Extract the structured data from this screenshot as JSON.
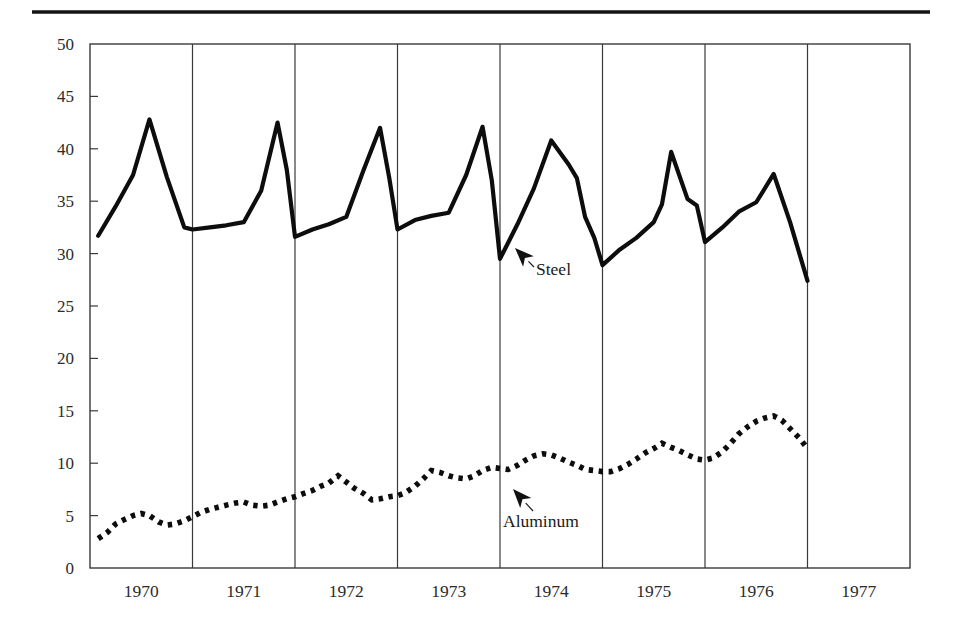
{
  "figure": {
    "top_rule": true,
    "background_color": "#ffffff",
    "line_color": "#0d0d0d",
    "axis_color": "#3a3a3a"
  },
  "annotations": [
    {
      "name": "steel",
      "label": "Steel",
      "label_x": 536,
      "label_y": 275,
      "arrow_tip_x": 515,
      "arrow_tip_y": 248,
      "arrow_tail_x": 534,
      "arrow_tail_y": 267
    },
    {
      "name": "aluminum",
      "label": "Aluminum",
      "label_x": 503,
      "label_y": 527,
      "arrow_tip_x": 513,
      "arrow_tip_y": 489,
      "arrow_tail_x": 533,
      "arrow_tail_y": 511
    }
  ],
  "chart_data": {
    "type": "line",
    "title": "",
    "subtitle": "",
    "xlabel": "",
    "ylabel": "",
    "xlim": [
      1969.5,
      1977.5
    ],
    "ylim": [
      0,
      50
    ],
    "grid": "vertical year boundaries",
    "legend_position": "inline-annotations",
    "y_ticks": [
      0,
      5,
      10,
      15,
      20,
      25,
      30,
      35,
      40,
      45,
      50
    ],
    "y_tick_labels": [
      "0",
      "5",
      "10",
      "15",
      "20",
      "25",
      "30",
      "35",
      "40",
      "45",
      "50"
    ],
    "x_tick_labels": [
      "1970",
      "1971",
      "1972",
      "1973",
      "1974",
      "1975",
      "1976",
      "1977"
    ],
    "x_gridline_years": [
      1970.5,
      1971.5,
      1972.5,
      1973.5,
      1974.5,
      1975.5,
      1976.5
    ],
    "series": [
      {
        "name": "Steel",
        "style": "solid",
        "x": [
          1969.58,
          1969.75,
          1969.92,
          1970.08,
          1970.25,
          1970.42,
          1970.5,
          1970.67,
          1970.83,
          1971.0,
          1971.17,
          1971.33,
          1971.42,
          1971.5,
          1971.67,
          1971.83,
          1972.0,
          1972.17,
          1972.33,
          1972.42,
          1972.5,
          1972.67,
          1972.83,
          1973.0,
          1973.17,
          1973.33,
          1973.42,
          1973.5,
          1973.67,
          1973.83,
          1974.0,
          1974.17,
          1974.25,
          1974.33,
          1974.42,
          1974.5,
          1974.67,
          1974.83,
          1975.0,
          1975.08,
          1975.17,
          1975.33,
          1975.42,
          1975.5,
          1975.67,
          1975.83,
          1976.0,
          1976.17,
          1976.33,
          1976.5
        ],
        "y": [
          31.7,
          34.5,
          37.5,
          42.8,
          37.3,
          32.5,
          32.3,
          32.5,
          32.7,
          33.0,
          36.0,
          42.5,
          38.0,
          31.6,
          32.3,
          32.8,
          33.5,
          38.0,
          42.0,
          37.2,
          32.3,
          33.2,
          33.6,
          33.9,
          37.5,
          42.1,
          37.0,
          29.5,
          32.8,
          36.2,
          40.8,
          38.5,
          37.2,
          33.5,
          31.5,
          28.9,
          30.4,
          31.5,
          33.0,
          34.7,
          39.7,
          35.2,
          34.6,
          31.1,
          32.5,
          34.0,
          34.9,
          37.6,
          33.0,
          27.4
        ]
      },
      {
        "name": "Aluminum",
        "style": "dotted",
        "x": [
          1969.58,
          1969.67,
          1969.75,
          1969.83,
          1969.92,
          1970.0,
          1970.08,
          1970.17,
          1970.25,
          1970.33,
          1970.42,
          1970.5,
          1970.58,
          1970.67,
          1970.75,
          1970.83,
          1970.92,
          1971.0,
          1971.08,
          1971.17,
          1971.25,
          1971.33,
          1971.42,
          1971.5,
          1971.58,
          1971.67,
          1971.75,
          1971.83,
          1971.92,
          1972.0,
          1972.08,
          1972.17,
          1972.25,
          1972.33,
          1972.42,
          1972.5,
          1972.58,
          1972.67,
          1972.75,
          1972.83,
          1972.92,
          1973.0,
          1973.08,
          1973.17,
          1973.25,
          1973.33,
          1973.42,
          1973.5,
          1973.58,
          1973.67,
          1973.75,
          1973.83,
          1973.92,
          1974.0,
          1974.08,
          1974.17,
          1974.25,
          1974.33,
          1974.42,
          1974.5,
          1974.58,
          1974.67,
          1974.75,
          1974.83,
          1974.92,
          1975.0,
          1975.08,
          1975.17,
          1975.25,
          1975.33,
          1975.42,
          1975.5,
          1975.58,
          1975.67,
          1975.75,
          1975.83,
          1975.92,
          1976.0,
          1976.08,
          1976.17,
          1976.25,
          1976.33,
          1976.42,
          1976.5
        ],
        "y": [
          2.8,
          3.4,
          4.2,
          4.6,
          5.0,
          5.2,
          5.0,
          4.4,
          4.1,
          4.2,
          4.5,
          4.9,
          5.3,
          5.6,
          5.8,
          6.0,
          6.2,
          6.3,
          6.0,
          5.9,
          6.0,
          6.3,
          6.6,
          6.8,
          7.1,
          7.4,
          7.8,
          8.1,
          8.8,
          8.2,
          7.6,
          7.1,
          6.5,
          6.6,
          6.8,
          6.9,
          7.2,
          7.8,
          8.5,
          9.3,
          9.1,
          8.8,
          8.6,
          8.5,
          8.8,
          9.3,
          9.6,
          9.5,
          9.4,
          9.8,
          10.3,
          10.7,
          10.9,
          10.8,
          10.5,
          10.1,
          9.8,
          9.4,
          9.3,
          9.2,
          9.2,
          9.5,
          9.9,
          10.4,
          11.0,
          11.4,
          11.9,
          11.5,
          11.2,
          10.8,
          10.4,
          10.3,
          10.5,
          11.1,
          11.9,
          12.8,
          13.5,
          14.0,
          14.3,
          14.5,
          14.1,
          13.3,
          12.4,
          11.4
        ]
      }
    ]
  }
}
